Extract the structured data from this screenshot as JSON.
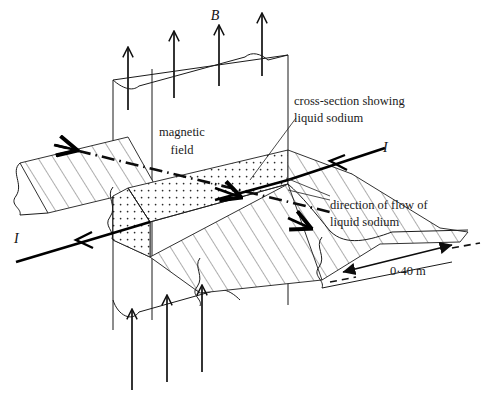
{
  "figure": {
    "domain": "Diagram",
    "background_color": "#ffffff",
    "ink_color": "#111111"
  },
  "labels": {
    "b_field_symbol": "B",
    "magnetic_field_line1": "magnetic",
    "magnetic_field_line2": "field",
    "cross_section_line1": "cross-section showing",
    "cross_section_line2": "liquid sodium",
    "flow_direction_line1": "direction of flow of",
    "flow_direction_line2": "liquid sodium",
    "current_right": "I",
    "current_left": "I",
    "dimension": "0·40 m"
  },
  "quantities": {
    "pipe_width_value": "0·40",
    "pipe_width_unit": "m",
    "pipe_width_label": "0·40 m",
    "magnetic_field_symbol": "B",
    "current_symbol": "I"
  },
  "elements": {
    "magnetic_field_region": "vertical slab with upward field arrows",
    "pipe": "horizontal hatched pipe running lower-left to upper-right",
    "cross_section": "stippled parallelogram where pipe meets field region",
    "current_arrows": "two bold arrows pointing toward lower-left",
    "flow_arrows": "small arrows along pipe axis pointing toward lower-right",
    "centerline": "dash-dot pipe axis line",
    "dimension_line": "double-headed arrow marking pipe width"
  },
  "styles": {
    "field_arrow_count_top": 4,
    "field_arrow_count_bottom": 3,
    "hatch_spacing_px": 13,
    "stipple_spacing_px": 7
  }
}
